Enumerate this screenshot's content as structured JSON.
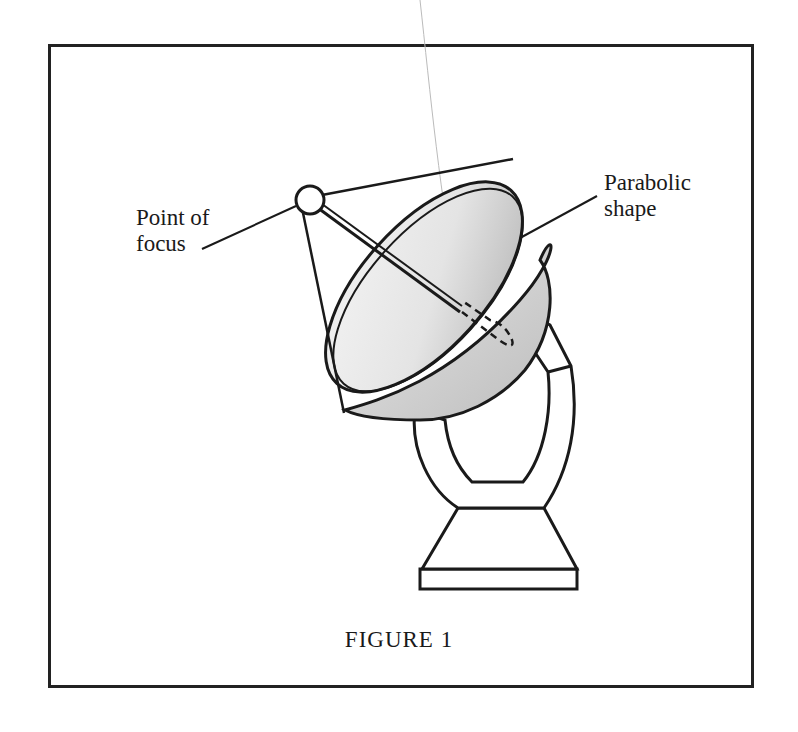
{
  "figure": {
    "caption": "FIGURE 1",
    "labels": {
      "point_of_focus": "Point of\nfocus",
      "parabolic_shape": "Parabolic\nshape"
    },
    "colors": {
      "ink": "#1a1a1a",
      "dish_shade_light": "#f2f2f2",
      "dish_shade_dark": "#b8b8b8",
      "background": "#ffffff"
    }
  }
}
